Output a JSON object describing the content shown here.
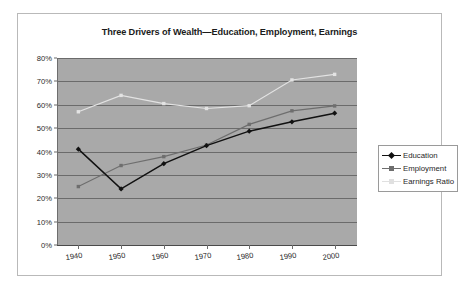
{
  "chart_data": {
    "type": "line",
    "title": "Three Drivers of Wealth—Education, Employment, Earnings",
    "xlabel": "",
    "ylabel": "",
    "categories": [
      "1940",
      "1950",
      "1960",
      "1970",
      "1980",
      "1990",
      "2000"
    ],
    "x": [
      1940,
      1950,
      1960,
      1970,
      1980,
      1990,
      2000
    ],
    "ylim": [
      0,
      80
    ],
    "yticks": [
      "0%",
      "10%",
      "20%",
      "30%",
      "40%",
      "50%",
      "60%",
      "70%",
      "80%"
    ],
    "ytick_values": [
      0,
      10,
      20,
      30,
      40,
      50,
      60,
      70,
      80
    ],
    "grid": true,
    "legend_position": "right",
    "plot_background": "#a9a9a9",
    "series": [
      {
        "name": "Education",
        "color": "#111111",
        "marker": "diamond",
        "values": [
          41,
          24,
          34.8,
          42.5,
          48.7,
          52.7,
          56.4
        ]
      },
      {
        "name": "Employment",
        "color": "#6e6e6e",
        "marker": "square",
        "values": [
          25,
          34,
          37.8,
          42.8,
          51.6,
          57.4,
          59.5
        ]
      },
      {
        "name": "Earnings Ratio",
        "color": "#e3e3e3",
        "marker": "square",
        "values": [
          57,
          64,
          60.5,
          58.4,
          59.6,
          70.6,
          73
        ]
      }
    ]
  },
  "legend": {
    "entries": [
      "Education",
      "Employment",
      "Earnings Ratio"
    ]
  }
}
